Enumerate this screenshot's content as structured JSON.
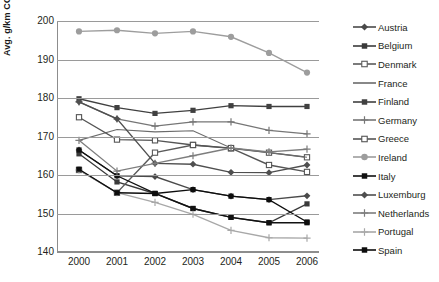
{
  "chart_data": {
    "type": "line",
    "title": "",
    "xlabel": "",
    "ylabel": "Avg. g/km CO2, new cars",
    "categories": [
      "2000",
      "2001",
      "2002",
      "2003",
      "2004",
      "2005",
      "2006"
    ],
    "x": [
      2000,
      2001,
      2002,
      2003,
      2004,
      2005,
      2006
    ],
    "ylim": [
      140,
      200
    ],
    "yticks": [
      140,
      150,
      160,
      170,
      180,
      190,
      200
    ],
    "grid": true,
    "legend_position": "right",
    "series": [
      {
        "name": "Austria",
        "marker": "diamond",
        "color": "#4a4a4a",
        "values": [
          166.5,
          159.8,
          159.6,
          156.2,
          154.5,
          153.6,
          154.6
        ]
      },
      {
        "name": "Belgium",
        "marker": "square-filled",
        "color": "#3a3a3a",
        "values": [
          165.5,
          158.2,
          155.2,
          151.3,
          149.0,
          147.6,
          152.5
        ]
      },
      {
        "name": "Denmark",
        "marker": "square-open",
        "color": "#5a5a5a",
        "values": [
          161.3,
          155.4,
          165.8,
          167.8,
          166.9,
          165.8,
          164.6
        ]
      },
      {
        "name": "France",
        "marker": "none",
        "color": "#6b6b6b",
        "values": [
          169.0,
          171.8,
          171.2,
          171.5,
          167.0,
          165.8,
          164.6
        ]
      },
      {
        "name": "Finland",
        "marker": "square-filled",
        "color": "#404040",
        "values": [
          179.8,
          177.5,
          176.0,
          176.8,
          178.0,
          177.8,
          177.8
        ]
      },
      {
        "name": "Germany",
        "marker": "plus",
        "color": "#767676",
        "values": [
          179.0,
          174.6,
          172.7,
          173.8,
          173.8,
          171.6,
          170.7
        ]
      },
      {
        "name": "Greece",
        "marker": "square-open",
        "color": "#555555",
        "values": [
          175.0,
          169.2,
          169.0,
          167.8,
          167.0,
          162.6,
          160.8
        ]
      },
      {
        "name": "Ireland",
        "marker": "circle",
        "color": "#9d9d9d",
        "values": [
          197.3,
          197.6,
          196.8,
          197.3,
          195.9,
          191.7,
          186.6
        ]
      },
      {
        "name": "Italy",
        "marker": "square-filled",
        "color": "#111111",
        "values": [
          166.5,
          159.8,
          155.2,
          151.3,
          149.0,
          147.6,
          147.6
        ]
      },
      {
        "name": "Luxemburg",
        "marker": "diamond",
        "color": "#4f4f4f",
        "values": [
          179.0,
          174.6,
          163.0,
          162.8,
          160.7,
          160.6,
          162.6
        ]
      },
      {
        "name": "Netherlands",
        "marker": "plus",
        "color": "#7d7d7d",
        "values": [
          169.0,
          161.0,
          163.0,
          165.0,
          167.0,
          166.0,
          166.7
        ]
      },
      {
        "name": "Portugal",
        "marker": "plus",
        "color": "#a8a8a8",
        "values": [
          161.3,
          155.4,
          152.9,
          149.8,
          145.6,
          143.7,
          143.6
        ]
      },
      {
        "name": "Spain",
        "marker": "square-filled",
        "color": "#0d0d0d",
        "values": [
          161.5,
          155.4,
          155.2,
          156.2,
          154.5,
          153.6,
          147.8
        ]
      }
    ]
  },
  "legend": {
    "items": [
      {
        "label": "Austria"
      },
      {
        "label": "Belgium"
      },
      {
        "label": "Denmark"
      },
      {
        "label": "France"
      },
      {
        "label": "Finland"
      },
      {
        "label": "Germany"
      },
      {
        "label": "Greece"
      },
      {
        "label": "Ireland"
      },
      {
        "label": "Italy"
      },
      {
        "label": "Luxemburg"
      },
      {
        "label": "Netherlands"
      },
      {
        "label": "Portugal"
      },
      {
        "label": "Spain"
      }
    ]
  }
}
